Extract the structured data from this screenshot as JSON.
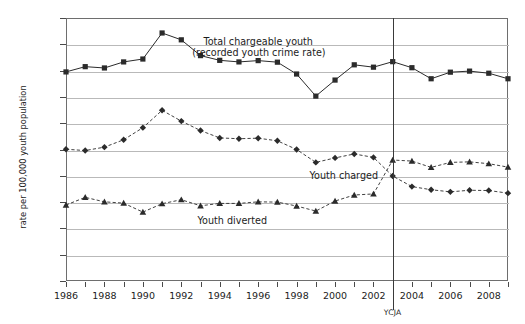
{
  "chart_data": {
    "type": "line",
    "title": "",
    "xlabel": "",
    "ylabel": "rate per 100,000 youth population",
    "xlim": [
      1986,
      2009
    ],
    "ylim": [
      0,
      10000
    ],
    "grid": true,
    "legend_position": "inline-annotations",
    "x": [
      1986,
      1987,
      1988,
      1989,
      1990,
      1991,
      1992,
      1993,
      1994,
      1995,
      1996,
      1997,
      1998,
      1999,
      2000,
      2001,
      2002,
      2003,
      2004,
      2005,
      2006,
      2007,
      2008,
      2009
    ],
    "y_ticks": [
      0,
      1000,
      2000,
      3000,
      4000,
      5000,
      6000,
      7000,
      8000,
      9000,
      10000
    ],
    "y_tick_labels": [
      "0",
      "1,000",
      "2,000",
      "3,000",
      "4,000",
      "5,000",
      "6,000",
      "7,000",
      "8,000",
      "9,000",
      "10,000"
    ],
    "x_tick_labels": [
      "1986",
      "1988",
      "1990",
      "1992",
      "1994",
      "1996",
      "1998",
      "2000",
      "2002",
      "2004",
      "2006",
      "2008"
    ],
    "x_tick_label_years": [
      1986,
      1988,
      1990,
      1992,
      1994,
      1996,
      1998,
      2000,
      2002,
      2004,
      2006,
      2008
    ],
    "series": [
      {
        "name": "Total chargeable youth (recorded youth crime rate)",
        "annotation_line1": "Total chargeable youth",
        "annotation_line2": "(recorded youth crime rate)",
        "style": "solid",
        "marker": "square",
        "values": [
          7950,
          8150,
          8100,
          8330,
          8440,
          9430,
          9170,
          8570,
          8390,
          8330,
          8380,
          8320,
          7870,
          7030,
          7640,
          8220,
          8130,
          8340,
          8110,
          7690,
          7940,
          7980,
          7900,
          7690
        ]
      },
      {
        "name": "Youth charged",
        "annotation_line1": "Youth charged",
        "annotation_line2": "",
        "style": "dashed",
        "marker": "diamond",
        "values": [
          5010,
          4960,
          5090,
          5370,
          5830,
          6490,
          6080,
          5720,
          5440,
          5410,
          5430,
          5330,
          5000,
          4510,
          4680,
          4830,
          4700,
          3990,
          3590,
          3470,
          3390,
          3450,
          3440,
          3340
        ]
      },
      {
        "name": "Youth diverted",
        "annotation_line1": "Youth diverted",
        "annotation_line2": "",
        "style": "dashed",
        "marker": "triangle",
        "values": [
          2890,
          3180,
          3010,
          2960,
          2620,
          2940,
          3090,
          2860,
          2950,
          2950,
          3010,
          3000,
          2850,
          2660,
          3040,
          3270,
          3310,
          4600,
          4560,
          4320,
          4510,
          4530,
          4460,
          4330
        ]
      }
    ],
    "marker_annotations": [
      {
        "label": "YCJA",
        "x_value": 2003
      }
    ]
  }
}
